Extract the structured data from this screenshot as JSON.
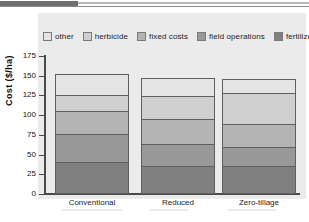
{
  "figure": {
    "y_axis_title": "Cost ($/ha)"
  },
  "legend": {
    "items": [
      {
        "label": "other",
        "color": "#e4e4e4"
      },
      {
        "label": "herbicide",
        "color": "#cfcfcf"
      },
      {
        "label": "fixed costs",
        "color": "#b4b4b4"
      },
      {
        "label": "field operations",
        "color": "#999999"
      },
      {
        "label": "fertilizer",
        "color": "#808080"
      }
    ]
  },
  "axis": {
    "y_ticks": [
      "175",
      "150",
      "125",
      "100",
      "75",
      "50",
      "25",
      "0"
    ],
    "x_labels": [
      "Conventional",
      "Reduced",
      "Zero-tillage"
    ]
  },
  "chart_data": {
    "type": "bar",
    "subtype": "stacked",
    "title": "",
    "xlabel": "",
    "ylabel": "Cost ($/ha)",
    "ylim": [
      0,
      175
    ],
    "ytick_interval": 25,
    "grid": false,
    "legend_position": "top",
    "categories": [
      "Conventional",
      "Reduced",
      "Zero-tillage"
    ],
    "series": [
      {
        "name": "fertilizer",
        "color": "#808080",
        "values": [
          41,
          35,
          36
        ]
      },
      {
        "name": "field operations",
        "color": "#999999",
        "values": [
          35,
          29,
          24
        ]
      },
      {
        "name": "fixed costs",
        "color": "#b4b4b4",
        "values": [
          29,
          31,
          29
        ]
      },
      {
        "name": "herbicide",
        "color": "#cfcfcf",
        "values": [
          21,
          29,
          39
        ]
      },
      {
        "name": "other",
        "color": "#e4e4e4",
        "values": [
          26,
          23,
          18
        ]
      }
    ],
    "totals": [
      152,
      147,
      146
    ],
    "stack_boundaries": {
      "Conventional": [
        41,
        76,
        105,
        126,
        152
      ],
      "Reduced": [
        35,
        64,
        95,
        124,
        147
      ],
      "Zero-tillage": [
        36,
        60,
        89,
        128,
        146
      ]
    }
  }
}
